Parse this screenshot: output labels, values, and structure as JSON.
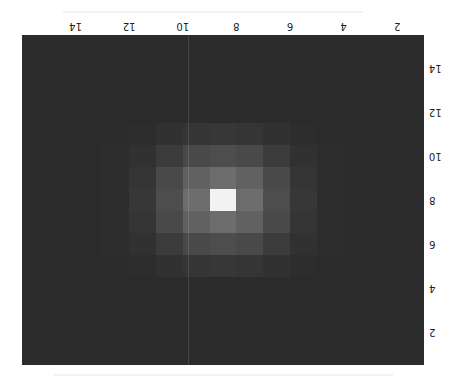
{
  "chart_data": {
    "type": "heatmap",
    "title": "",
    "xlabel": "",
    "ylabel": "",
    "colormap": "gray",
    "orientation_note": "figure rendered rotated 180 degrees",
    "grid": false,
    "x": [
      1,
      2,
      3,
      4,
      5,
      6,
      7,
      8,
      9,
      10,
      11,
      12,
      13,
      14,
      15
    ],
    "y": [
      1,
      2,
      3,
      4,
      5,
      6,
      7,
      8,
      9,
      10,
      11,
      12,
      13,
      14,
      15
    ],
    "xticks": [
      2,
      4,
      6,
      8,
      10,
      12,
      14
    ],
    "yticks": [
      2,
      4,
      6,
      8,
      10,
      12,
      14
    ],
    "xtick_labels": [
      "2",
      "4",
      "6",
      "8",
      "10",
      "12",
      "14"
    ],
    "ytick_labels": [
      "2",
      "4",
      "6",
      "8",
      "10",
      "12",
      "14"
    ],
    "xlim": [
      0.5,
      15.5
    ],
    "ylim": [
      0.5,
      15.5
    ],
    "peak": {
      "x": 8,
      "y": 8,
      "value": 1.0
    },
    "sigma": 1.6,
    "values": [
      [
        0,
        0,
        0,
        0,
        0,
        0,
        0,
        0,
        0,
        0,
        0,
        0,
        0,
        0,
        0
      ],
      [
        0,
        0,
        0,
        0,
        0,
        0,
        0,
        0,
        0,
        0,
        0,
        0,
        0,
        0,
        0
      ],
      [
        0,
        0,
        0,
        0,
        0,
        0,
        0,
        0,
        0,
        0,
        0,
        0,
        0,
        0,
        0
      ],
      [
        0,
        0,
        0,
        0,
        0,
        0,
        0,
        0,
        0,
        0,
        0,
        0,
        0,
        0,
        0
      ],
      [
        0,
        0,
        0,
        0,
        0.01,
        0.03,
        0.05,
        0.06,
        0.05,
        0.03,
        0.01,
        0,
        0,
        0,
        0
      ],
      [
        0,
        0,
        0,
        0.01,
        0.03,
        0.08,
        0.15,
        0.17,
        0.15,
        0.08,
        0.03,
        0.01,
        0,
        0,
        0
      ],
      [
        0,
        0,
        0,
        0.01,
        0.05,
        0.15,
        0.27,
        0.33,
        0.27,
        0.15,
        0.05,
        0.01,
        0,
        0,
        0
      ],
      [
        0,
        0,
        0,
        0.01,
        0.06,
        0.17,
        0.33,
        1.0,
        0.33,
        0.17,
        0.06,
        0.01,
        0,
        0,
        0
      ],
      [
        0,
        0,
        0,
        0.01,
        0.05,
        0.15,
        0.27,
        0.33,
        0.27,
        0.15,
        0.05,
        0.01,
        0,
        0,
        0
      ],
      [
        0,
        0,
        0,
        0.01,
        0.03,
        0.08,
        0.15,
        0.17,
        0.15,
        0.08,
        0.03,
        0.01,
        0,
        0,
        0
      ],
      [
        0,
        0,
        0,
        0,
        0.01,
        0.03,
        0.05,
        0.06,
        0.05,
        0.03,
        0.01,
        0,
        0,
        0,
        0
      ],
      [
        0,
        0,
        0,
        0,
        0,
        0,
        0,
        0,
        0,
        0,
        0,
        0,
        0,
        0,
        0
      ],
      [
        0,
        0,
        0,
        0,
        0,
        0,
        0,
        0,
        0,
        0,
        0,
        0,
        0,
        0,
        0
      ],
      [
        0,
        0,
        0,
        0,
        0,
        0,
        0,
        0,
        0,
        0,
        0,
        0,
        0,
        0,
        0
      ],
      [
        0,
        0,
        0,
        0,
        0,
        0,
        0,
        0,
        0,
        0,
        0,
        0,
        0,
        0,
        0
      ]
    ]
  },
  "colors": {
    "background": "#2b2b2b",
    "peak": "#f2f2f2",
    "text": "#222222"
  }
}
